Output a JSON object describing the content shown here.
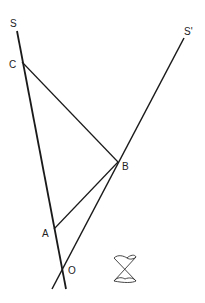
{
  "diagram": {
    "type": "geometry",
    "labels": {
      "S": "S",
      "S_prime": "S'",
      "C": "C",
      "B": "B",
      "A": "A",
      "O": "O"
    },
    "points": {
      "S_end": [
        17,
        31
      ],
      "C": [
        22,
        62
      ],
      "A": [
        54,
        229
      ],
      "O": [
        62,
        268
      ],
      "S_bottom": [
        66,
        289
      ],
      "S_prime_end": [
        184,
        38
      ],
      "B": [
        118,
        162
      ],
      "S_prime_bottom": [
        52,
        289
      ]
    },
    "segments": [
      {
        "name": "line-S",
        "from": "S_end",
        "to": "S_bottom"
      },
      {
        "name": "line-S-prime",
        "from": "S_prime_end",
        "to": "S_prime_bottom"
      },
      {
        "name": "segment-CB",
        "from": "C",
        "to": "B"
      },
      {
        "name": "segment-AB",
        "from": "A",
        "to": "B"
      }
    ],
    "symbol": "disjoint-union-glyph",
    "colors": {
      "stroke": "#1a1a1a",
      "text": "#222222",
      "background": "#ffffff"
    }
  }
}
